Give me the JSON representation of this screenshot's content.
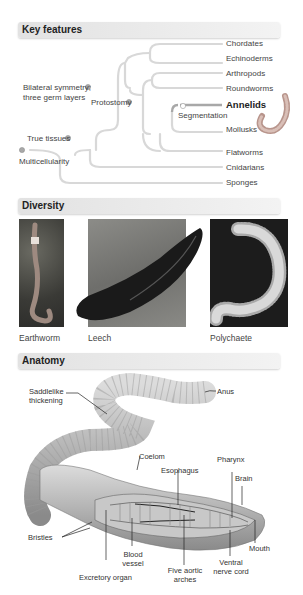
{
  "sections": {
    "key_features": "Key features",
    "diversity": "Diversity",
    "anatomy": "Anatomy"
  },
  "tree": {
    "taxa": [
      "Chordates",
      "Echinoderms",
      "Arthropods",
      "Roundworms",
      "Annelids",
      "Mollusks",
      "Flatworms",
      "Cnidarians",
      "Sponges"
    ],
    "highlighted": "Annelids",
    "nodes": {
      "bilateral": [
        "Bilateral symmetry;",
        "three germ layers"
      ],
      "protostomy": "Protostomy",
      "segmentation": "Segmentation",
      "true_tissues": "True tissues",
      "multicellularity": "Multicellularity"
    }
  },
  "diversity": {
    "captions": [
      "Earthworm",
      "Leech",
      "Polychaete"
    ]
  },
  "anatomy": {
    "labels": {
      "saddle": [
        "Saddlelike",
        "thickening"
      ],
      "anus": "Anus",
      "coelom": "Coelom",
      "esophagus": "Esophagus",
      "pharynx": "Pharynx",
      "brain": "Brain",
      "bristles": "Bristles",
      "blood_vessel": [
        "Blood",
        "vessel"
      ],
      "mouth": "Mouth",
      "ventral": [
        "Ventral",
        "nerve cord"
      ],
      "aortic": [
        "Five aortic",
        "arches"
      ],
      "excretory": "Excretory organ"
    }
  },
  "colors": {
    "tree_line": "#d4d4d4",
    "highlight_line": "#9a9a9a",
    "node_dot": "#9a9a9a",
    "worm_pink": "#c9a9a0"
  }
}
